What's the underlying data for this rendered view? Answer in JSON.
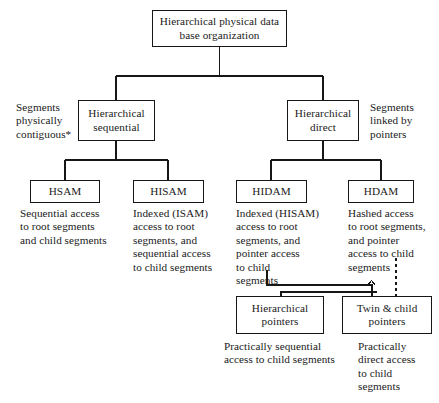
{
  "diagram": {
    "title": "Hierarchical physical data base organization",
    "type": "tree",
    "root": {
      "label": "Hierarchical\nphysical data base\norganization"
    },
    "level2": {
      "left": {
        "label": "Hierarchical\nsequential"
      },
      "right": {
        "label": "Hierarchical\ndirect"
      }
    },
    "side_labels": {
      "left": "Segments\nphysically\ncontiguous*",
      "right": "Segments\nlinked by\npointers"
    },
    "leaves": {
      "hsam": {
        "label": "HSAM",
        "description": "Sequential access\nto root segments\nand child segments"
      },
      "hisam": {
        "label": "HISAM",
        "description": "Indexed (ISAM)\naccess to root\nsegments, and\nsequential access\nto child segments"
      },
      "hidam": {
        "label": "HIDAM",
        "description": "Indexed (HISAM)\naccess to root\nsegments, and\npointer access\nto child\nsegments"
      },
      "hdam": {
        "label": "HDAM",
        "description": "Hashed access\nto root segments,\nand pointer\naccess to child\nsegments"
      }
    },
    "pointer_nodes": {
      "hierarchical_pointers": {
        "label": "Hierarchical\npointers",
        "description": "Practically sequential\naccess to child segments"
      },
      "twin_child_pointers": {
        "label": "Twin & child\npointers",
        "description": "Practically\ndirect access\nto child\nsegments"
      }
    },
    "colors": {
      "line": "#161616",
      "text": "#1a1a1a",
      "background": "#ffffff"
    }
  }
}
